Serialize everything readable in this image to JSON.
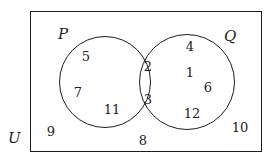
{
  "diagram": {
    "stroke_color": "#1d1d1d",
    "background_color": "#ffffff",
    "labels": {
      "universal_set": "U",
      "left_set": "P",
      "right_set": "Q"
    },
    "regions": {
      "p_only": {
        "name": "P only",
        "values": [
          5,
          7,
          11
        ]
      },
      "intersection": {
        "name": "P intersect Q",
        "values": [
          2,
          3
        ]
      },
      "q_only": {
        "name": "Q only",
        "values": [
          4,
          1,
          6,
          12
        ]
      },
      "outside": {
        "name": "Outside both sets",
        "values": [
          9,
          8,
          10
        ]
      }
    },
    "elements": [
      {
        "value": "5",
        "region": "p_only",
        "x": 86,
        "y": 56
      },
      {
        "value": "7",
        "region": "p_only",
        "x": 78,
        "y": 92
      },
      {
        "value": "11",
        "region": "p_only",
        "x": 112,
        "y": 109
      },
      {
        "value": "2",
        "region": "intersection",
        "x": 148,
        "y": 66
      },
      {
        "value": "3",
        "region": "intersection",
        "x": 148,
        "y": 99
      },
      {
        "value": "4",
        "region": "q_only",
        "x": 190,
        "y": 46
      },
      {
        "value": "1",
        "region": "q_only",
        "x": 190,
        "y": 72
      },
      {
        "value": "6",
        "region": "q_only",
        "x": 208,
        "y": 87
      },
      {
        "value": "12",
        "region": "q_only",
        "x": 192,
        "y": 113
      },
      {
        "value": "9",
        "region": "outside",
        "x": 51,
        "y": 131
      },
      {
        "value": "8",
        "region": "outside",
        "x": 143,
        "y": 140
      },
      {
        "value": "10",
        "region": "outside",
        "x": 240,
        "y": 127
      }
    ]
  }
}
